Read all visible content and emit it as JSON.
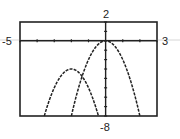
{
  "window": {
    "xmin": "-5",
    "xmax": "3",
    "ymax": "2",
    "ymin": "-8"
  },
  "chart_data": {
    "type": "line",
    "title": "",
    "xlabel": "",
    "ylabel": "",
    "xlim": [
      -5,
      3
    ],
    "ylim": [
      -8,
      2
    ],
    "tick_spacing": 1,
    "grid": false,
    "legend": "none",
    "annotations": [
      "-5",
      "3",
      "2",
      "-8"
    ],
    "series": [
      {
        "name": "y = -2x^2",
        "vertex": [
          0,
          0
        ],
        "x": [
          -2,
          -1.5,
          -1,
          -0.5,
          0,
          0.5,
          1,
          1.5,
          2
        ],
        "y": [
          -8,
          -4.5,
          -2,
          -0.5,
          0,
          -0.5,
          -2,
          -4.5,
          -8
        ]
      },
      {
        "name": "y = -2(x+2)^2 - 3",
        "vertex": [
          -2,
          -3
        ],
        "x": [
          -3.58,
          -3.5,
          -3,
          -2.5,
          -2,
          -1.5,
          -1,
          -0.5,
          -0.42
        ],
        "y": [
          -8,
          -7.5,
          -5,
          -3.5,
          -3,
          -3.5,
          -5,
          -7.5,
          -8
        ]
      }
    ],
    "style": {
      "stroke": "#222222",
      "dashed": true,
      "axis_color": "#222222",
      "frame_color": "#222222"
    }
  }
}
